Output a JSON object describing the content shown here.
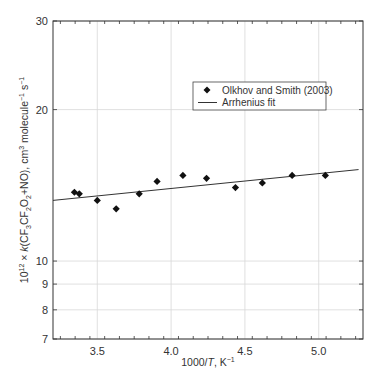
{
  "chart_data": {
    "type": "scatter",
    "title": "",
    "xlabel": "1000/T, K⁻¹",
    "xlabel_parts": {
      "prefix": "1000/",
      "italic": "T",
      "suffix": ", K",
      "sup": "−1"
    },
    "ylabel": "10^12 × k(CF3CF2O2+NO), cm^3 molecule^-1 s^-1",
    "ylabel_parts": {
      "p1": "10",
      "s1": "12",
      "p2": " × ",
      "k": "k",
      "p3": "(CF",
      "sub1": "3",
      "p4": "CF",
      "sub2": "2",
      "p5": "O",
      "sub3": "2",
      "p6": "+NO), cm",
      "s2": "3",
      "p7": " molecule",
      "s3": "−1",
      "p8": " s",
      "s4": "−1"
    },
    "xlim": [
      3.2,
      5.3
    ],
    "ylim": [
      7,
      30
    ],
    "yscale": "log",
    "grid": true,
    "x_ticks": [
      3.5,
      4.0,
      4.5,
      5.0
    ],
    "x_tick_labels": [
      "3.5",
      "4.0",
      "4.5",
      "5.0"
    ],
    "y_ticks": [
      7,
      8,
      9,
      10,
      20,
      30
    ],
    "y_tick_labels": [
      "7",
      "8",
      "9",
      "10",
      "20",
      "30"
    ],
    "legend_position": "upper right (inside)",
    "series": [
      {
        "name": "Olkhov and Smith (2003)",
        "type": "scatter",
        "marker": "diamond",
        "color": "#111111",
        "x": [
          3.345,
          3.378,
          3.5,
          3.628,
          3.784,
          3.905,
          4.08,
          4.24,
          4.436,
          4.618,
          4.82,
          5.045
        ],
        "y": [
          13.7,
          13.6,
          13.2,
          12.7,
          13.6,
          14.4,
          14.8,
          14.6,
          14.0,
          14.3,
          14.8,
          14.8
        ]
      },
      {
        "name": "Arrhenius fit",
        "type": "line",
        "color": "#333333",
        "x": [
          3.2,
          5.27
        ],
        "y": [
          13.2,
          15.2
        ]
      }
    ]
  }
}
